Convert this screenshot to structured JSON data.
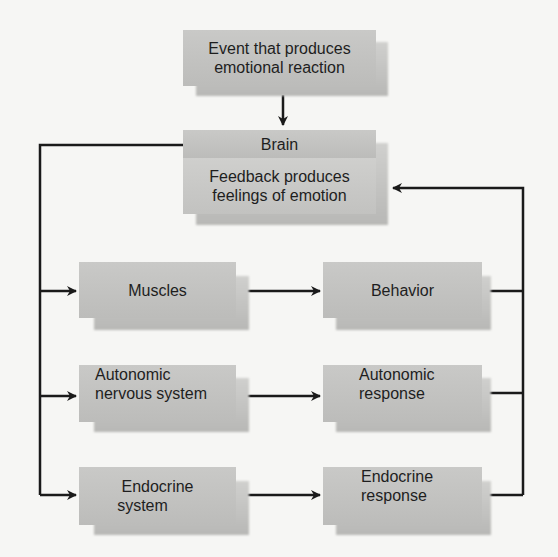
{
  "diagram": {
    "event": {
      "line1": "Event that produces",
      "line2": "emotional reaction"
    },
    "brain": {
      "title": "Brain",
      "line1": "Feedback produces",
      "line2": "feelings of emotion"
    },
    "left_column": [
      {
        "line1": "Muscles",
        "line2": ""
      },
      {
        "line1": "Autonomic",
        "line2": "nervous system"
      },
      {
        "line1": "Endocrine",
        "line2": "system"
      }
    ],
    "right_column": [
      {
        "line1": "Behavior",
        "line2": ""
      },
      {
        "line1": "Autonomic",
        "line2": "response"
      },
      {
        "line1": "Endocrine",
        "line2": "response"
      }
    ],
    "colors": {
      "box": "#c4c4c2",
      "line": "#1a1a1a",
      "background": "#f6f6f4"
    }
  }
}
